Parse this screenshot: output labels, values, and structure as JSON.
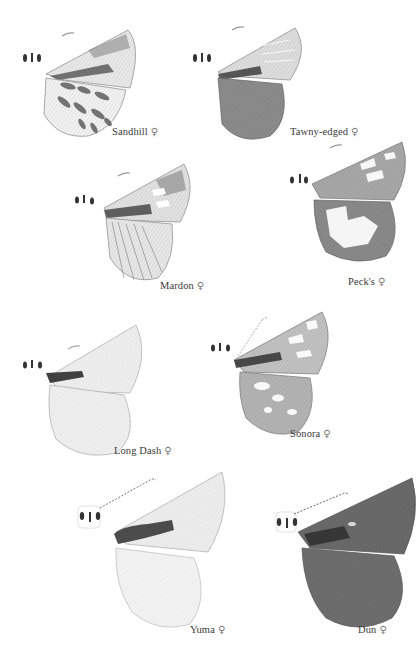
{
  "plate": {
    "subject": "Skipper butterflies, female specimens (half-wing illustrations)",
    "sex_symbol": "♀",
    "specimens": [
      {
        "name": "Sandhill",
        "sex": "♀",
        "tone": "#5a5a5a",
        "pattern": "spotted-hindwing"
      },
      {
        "name": "Tawny-edged",
        "sex": "♀",
        "tone": "#6b6b6b",
        "pattern": "dark-hindwing"
      },
      {
        "name": "Mardon",
        "sex": "♀",
        "tone": "#707070",
        "pattern": "streaked"
      },
      {
        "name": "Peck's",
        "sex": "♀",
        "tone": "#5f5f5f",
        "pattern": "pale-patch-hindwing"
      },
      {
        "name": "Long Dash",
        "sex": "♀",
        "tone": "#9a9a9a",
        "pattern": "pale-with-dash"
      },
      {
        "name": "Sonora",
        "sex": "♀",
        "tone": "#6a6a6a",
        "pattern": "spotted"
      },
      {
        "name": "Yuma",
        "sex": "♀",
        "tone": "#b5b5b5",
        "pattern": "pale-with-dash"
      },
      {
        "name": "Dun",
        "sex": "♀",
        "tone": "#4e4e4e",
        "pattern": "dark-uniform"
      }
    ]
  }
}
